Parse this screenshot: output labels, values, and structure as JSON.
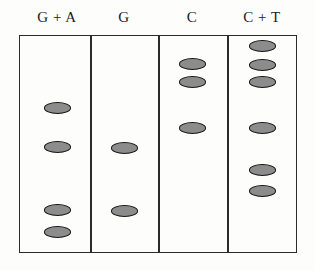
{
  "figure": {
    "type": "sequencing-gel-autoradiogram",
    "width": 315,
    "height": 271,
    "background_color": "#fdfdfc",
    "frame": {
      "x": 19,
      "y": 35,
      "width": 278,
      "height": 218,
      "border_color": "#2b2b2b"
    },
    "band_style": {
      "fill_color": "#8c8c8c",
      "outline_color": "#161616",
      "width": 27,
      "height": 11.5,
      "shape": "ellipse"
    },
    "dividers_x": [
      90,
      158,
      227
    ],
    "lanes": [
      {
        "label": "G + A",
        "name": "lane-g-plus-a",
        "center_x": 57,
        "label_x": 57,
        "band_count": 4,
        "bands_y": [
          108,
          147,
          210,
          232
        ]
      },
      {
        "label": "G",
        "name": "lane-g",
        "center_x": 124,
        "label_x": 124,
        "band_count": 2,
        "bands_y": [
          148,
          211
        ]
      },
      {
        "label": "C",
        "name": "lane-c",
        "center_x": 192,
        "label_x": 192,
        "band_count": 3,
        "bands_y": [
          64,
          82,
          128
        ]
      },
      {
        "label": "C + T",
        "name": "lane-c-plus-t",
        "center_x": 262,
        "label_x": 262,
        "band_count": 6,
        "bands_y": [
          46,
          65,
          82,
          128,
          170,
          191
        ]
      }
    ]
  }
}
